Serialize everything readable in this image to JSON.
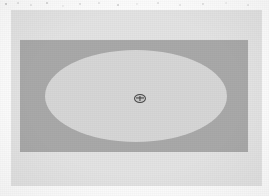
{
  "figure": {
    "caption": "",
    "medium": "grayscale scanned diagram",
    "width_px": 269,
    "height_px": 196
  },
  "colors": {
    "page_background": "#fdfdfd",
    "panel_background": "#e3e3e3",
    "field_rectangle": "#a9a9a9",
    "ellipse_fill": "#d6d6d6",
    "marker_outline": "#4a4a4a",
    "marker_fill": "#c9c9c9",
    "marker_cross": "#3d3d3d"
  },
  "shapes": {
    "panel": {
      "name": "plot-panel",
      "label": "",
      "x": 11,
      "y": 10,
      "width": 251,
      "height": 176
    },
    "field": {
      "name": "field-rectangle",
      "label": "",
      "x": 20,
      "y": 40,
      "width": 228,
      "height": 112
    },
    "ellipse": {
      "name": "region-ellipse",
      "label": "",
      "center_x": 136,
      "center_y": 96,
      "radius_x": 91,
      "radius_y": 46
    },
    "marker": {
      "name": "center-marker",
      "icon": "crosshair-plus-icon",
      "label": "",
      "center_x": 140,
      "center_y": 98,
      "width": 12,
      "height": 9
    }
  },
  "annotations": {
    "top_speckle": "",
    "alt_text": "A light gray rectangular panel containing a darker gray rectangle, within which a large pale ellipse is inscribed; a small dark oval marker with a plus sign sits at the ellipse center."
  }
}
